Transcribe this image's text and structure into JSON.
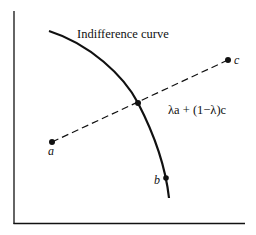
{
  "diagram": {
    "curve_label": "Indifference curve",
    "point_a": "a",
    "point_b": "b",
    "point_c": "c",
    "lambda_label": "λa + (1−λ)c",
    "colors": {
      "ink": "#111111",
      "background": "#ffffff"
    }
  }
}
